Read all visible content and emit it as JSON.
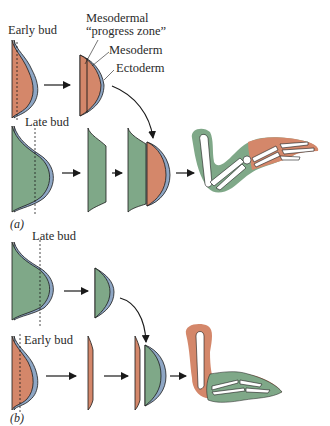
{
  "figure": {
    "colors": {
      "mesoderm_early": "#d4876a",
      "mesoderm_late": "#7fa888",
      "ectoderm": "#8ea6c4",
      "outline": "#1a1a1a",
      "bone": "#ffffff"
    },
    "panel_a": {
      "label": "(a)",
      "top_row": {
        "bud_label": "Early bud",
        "annotation_progress_zone_line1": "Mesodermal",
        "annotation_progress_zone_line2": "“progress zone”",
        "annotation_mesoderm": "Mesoderm",
        "annotation_ectoderm": "Ectoderm"
      },
      "bottom_row": {
        "bud_label": "Late bud"
      }
    },
    "panel_b": {
      "label": "(b)",
      "top_row": {
        "bud_label": "Late bud"
      },
      "bottom_row": {
        "bud_label": "Early bud"
      }
    }
  }
}
